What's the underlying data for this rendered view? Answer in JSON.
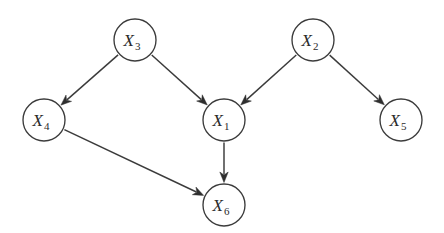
{
  "figure": {
    "background_color": "#ffffff",
    "stroke_color": "#3b3b3b",
    "label_color": "#2b2b2b",
    "width": 444,
    "height": 233
  },
  "graph": {
    "type": "directed-acyclic-graph",
    "node_radius": 21,
    "nodes": [
      {
        "id": "X3",
        "base": "X",
        "subscript": "3",
        "label": "X3",
        "cx": 135,
        "cy": 40
      },
      {
        "id": "X2",
        "base": "X",
        "subscript": "2",
        "label": "X2",
        "cx": 313,
        "cy": 40
      },
      {
        "id": "X4",
        "base": "X",
        "subscript": "4",
        "label": "X4",
        "cx": 44,
        "cy": 120
      },
      {
        "id": "X1",
        "base": "X",
        "subscript": "1",
        "label": "X1",
        "cx": 224,
        "cy": 120
      },
      {
        "id": "X5",
        "base": "X",
        "subscript": "5",
        "label": "X5",
        "cx": 401,
        "cy": 120
      },
      {
        "id": "X6",
        "base": "X",
        "subscript": "6",
        "label": "X6",
        "cx": 224,
        "cy": 205
      }
    ],
    "edges": [
      {
        "id": "e1",
        "from": "X3",
        "to": "X4",
        "directed": true
      },
      {
        "id": "e2",
        "from": "X3",
        "to": "X1",
        "directed": true
      },
      {
        "id": "e3",
        "from": "X2",
        "to": "X1",
        "directed": true
      },
      {
        "id": "e4",
        "from": "X2",
        "to": "X5",
        "directed": true
      },
      {
        "id": "e5",
        "from": "X1",
        "to": "X6",
        "directed": true
      },
      {
        "id": "e6",
        "from": "X4",
        "to": "X6",
        "directed": true
      }
    ]
  }
}
